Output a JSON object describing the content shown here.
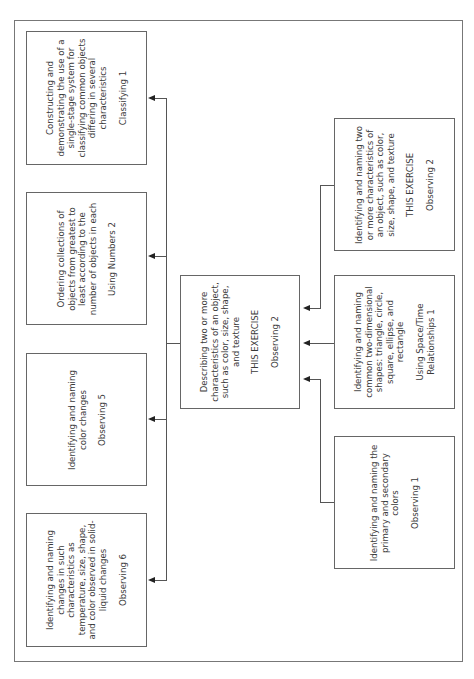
{
  "diagram": {
    "orientation": "rotated-90-ccw",
    "left_column": [
      {
        "id": "classifying-1",
        "description": "Constructing and demonstrating the use of a single-stage system for classifying common objects differing in several characteristics",
        "code": "Classifying 1"
      },
      {
        "id": "using-numbers-2",
        "description": "Ordering collections of objects from greatest to least according to the number of objects in each",
        "code": "Using Numbers 2"
      },
      {
        "id": "observing-5",
        "description": "Identifying and naming color changes",
        "code": "Observing 5"
      },
      {
        "id": "observing-6",
        "description": "Identifying and naming changes in such characteristics as temperature, size, shape, and color observed in solid-liquid changes",
        "code": "Observing 6"
      }
    ],
    "center": {
      "id": "observing-2-center",
      "description": "Describing two or more characteristics of an object, such as color, size, shape, and texture",
      "tag": "THIS EXERCISE",
      "code": "Observing 2"
    },
    "right_column": [
      {
        "id": "observing-2-prereq",
        "description": "Identifying and naming two or more characteristics of an object, such as color, size, shape, and texture",
        "tag": "THIS EXERCISE",
        "code": "Observing 2"
      },
      {
        "id": "space-time-1",
        "description": "Identifying and naming common two-dimensional shapes: triangle, circle, square, ellipse, and rectangle",
        "code": "Using Space/Time Relationships 1"
      },
      {
        "id": "observing-1",
        "description": "Identifying and naming the primary and secondary colors",
        "code": "Observing 1"
      }
    ]
  }
}
